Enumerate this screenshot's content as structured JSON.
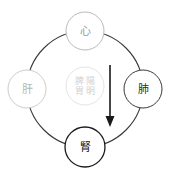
{
  "diagram": {
    "type": "tcm-organ-cycle",
    "background_color": "#ffffff",
    "main_circle": {
      "name": "outer-cycle-ring",
      "cx": 85,
      "cy": 89,
      "r": 58,
      "stroke_color": "#3a3a3a",
      "stroke_width": 1.1,
      "fill": "none"
    },
    "nodes": [
      {
        "id": "heart",
        "position": "top",
        "label": "心",
        "cx": 85,
        "cy": 31,
        "r": 19,
        "stroke_color": "#b9b9b9",
        "text_color": "#9a9a9a",
        "font_size": 11
      },
      {
        "id": "liver",
        "position": "left",
        "label": "肝",
        "cx": 27,
        "cy": 89,
        "r": 19,
        "stroke_color": "#cccccc",
        "text_color": "#b5b5b5",
        "font_size": 11
      },
      {
        "id": "lung",
        "position": "right",
        "label": "肺",
        "cx": 143,
        "cy": 89,
        "r": 19,
        "stroke_color": "#3a3a3a",
        "text_color": "#2b2b2b",
        "font_size": 11
      },
      {
        "id": "kidney",
        "position": "bottom",
        "label": "腎",
        "cx": 85,
        "cy": 147,
        "r": 20,
        "stroke_color": "#1a1a1a",
        "text_color": "#141414",
        "font_size": 11
      }
    ],
    "center": {
      "id": "spleen-stomach",
      "cx": 85,
      "cy": 86,
      "r": 19,
      "stroke_color": "#e0e0e0",
      "text_color": "#d2d2d2",
      "font_size": 9,
      "columns": [
        {
          "id": "col-left",
          "chars": [
            "脾",
            "胃"
          ]
        },
        {
          "id": "col-right",
          "chars": [
            "陽",
            "明"
          ]
        }
      ],
      "full_text": "脾陽明胃"
    },
    "arrow": {
      "id": "descending-arrow",
      "direction": "down",
      "x": 110,
      "y_start": 65,
      "y_end": 127,
      "color": "#1a1a1a",
      "stroke_width": 1.6,
      "head_width": 9,
      "head_length": 11
    }
  }
}
